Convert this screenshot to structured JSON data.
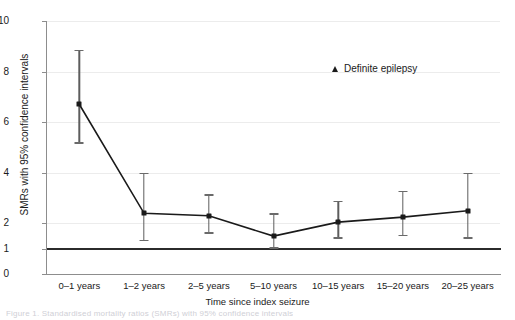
{
  "chart_data": {
    "type": "line",
    "title": "",
    "xlabel": "Time since index seizure",
    "ylabel": "SMRs with 95% confidence intervals",
    "categories": [
      "0–1 years",
      "1–2 years",
      "2–5 years",
      "5–10 years",
      "10–15 years",
      "15–20 years",
      "20–25 years"
    ],
    "ylim": [
      0,
      10
    ],
    "ytick_labels": [
      "0",
      "1",
      "2",
      "4",
      "6",
      "8",
      "10"
    ],
    "ytick_values": [
      0,
      1,
      2,
      4,
      6,
      8,
      10
    ],
    "grid": "horizontal",
    "legend_position": "inside-top-right",
    "reference_line": {
      "value": 1,
      "color": "#2b2b2b",
      "label": ""
    },
    "series": [
      {
        "name": "Definite epilepsy",
        "marker": "triangle",
        "color": "#1a1a1a",
        "values": [
          6.7,
          2.4,
          2.3,
          1.5,
          2.05,
          2.25,
          2.5
        ],
        "ci_lower": [
          5.2,
          1.35,
          1.65,
          1.05,
          1.45,
          1.55,
          1.45
        ],
        "ci_upper": [
          8.85,
          4.0,
          3.15,
          2.4,
          2.9,
          3.3,
          4.0
        ]
      }
    ]
  },
  "legend": {
    "entries": [
      {
        "label": "Definite epilepsy",
        "marker": "triangle-icon",
        "color": "#1a1a1a"
      }
    ]
  },
  "caption": {
    "text": "Figure 1. Standardised mortality ratios (SMRs) with 95% confidence intervals"
  }
}
